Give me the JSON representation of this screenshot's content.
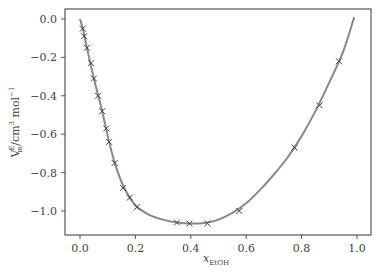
{
  "chart_data": {
    "type": "line",
    "title": "",
    "xlabel": "x_EtOH",
    "xlabel_main": "x",
    "xlabel_sub": "EtOH",
    "ylabel": "V_m^E /cm^3 mol^-1",
    "ylabel_main": "V",
    "ylabel_sub": "m",
    "ylabel_sup": "E",
    "ylabel_unit": "/cm",
    "ylabel_unit_sup": "3",
    "ylabel_unit2": " mol",
    "ylabel_unit2_sup": "−1",
    "xlim": [
      -0.05,
      1.05
    ],
    "ylim": [
      -1.125,
      0.057
    ],
    "grid": false,
    "legend": null,
    "xticks": [
      0.0,
      0.2,
      0.4,
      0.6,
      0.8,
      1.0
    ],
    "xtick_labels": [
      "0.0",
      "0.2",
      "0.4",
      "0.6",
      "0.8",
      "1.0"
    ],
    "yticks": [
      0.0,
      -0.2,
      -0.4,
      -0.6,
      -0.8,
      -1.0
    ],
    "ytick_labels": [
      "0.0",
      "−0.2",
      "−0.4",
      "−0.6",
      "−0.8",
      "−1.0"
    ],
    "series": [
      {
        "name": "experimental",
        "style": "markers",
        "marker": "x",
        "color": "#444444",
        "x": [
          0.01,
          0.015,
          0.025,
          0.04,
          0.05,
          0.065,
          0.08,
          0.095,
          0.105,
          0.125,
          0.155,
          0.18,
          0.205,
          0.35,
          0.395,
          0.46,
          0.575,
          0.775,
          0.865,
          0.935
        ],
        "y": [
          -0.05,
          -0.09,
          -0.15,
          -0.23,
          -0.31,
          -0.4,
          -0.48,
          -0.57,
          -0.64,
          -0.75,
          -0.88,
          -0.93,
          -0.98,
          -1.06,
          -1.065,
          -1.065,
          -1.0,
          -0.67,
          -0.45,
          -0.22
        ]
      },
      {
        "name": "fit",
        "style": "line",
        "color": "#888888",
        "x": [
          0.0,
          0.01,
          0.025,
          0.05,
          0.08,
          0.105,
          0.13,
          0.16,
          0.2,
          0.25,
          0.3,
          0.35,
          0.4,
          0.45,
          0.5,
          0.55,
          0.6,
          0.65,
          0.7,
          0.75,
          0.8,
          0.85,
          0.9,
          0.95,
          0.99
        ],
        "y": [
          0.0,
          -0.05,
          -0.15,
          -0.31,
          -0.48,
          -0.64,
          -0.77,
          -0.88,
          -0.97,
          -1.02,
          -1.045,
          -1.06,
          -1.065,
          -1.062,
          -1.045,
          -1.01,
          -0.96,
          -0.89,
          -0.81,
          -0.72,
          -0.61,
          -0.48,
          -0.33,
          -0.17,
          0.01
        ]
      }
    ]
  }
}
